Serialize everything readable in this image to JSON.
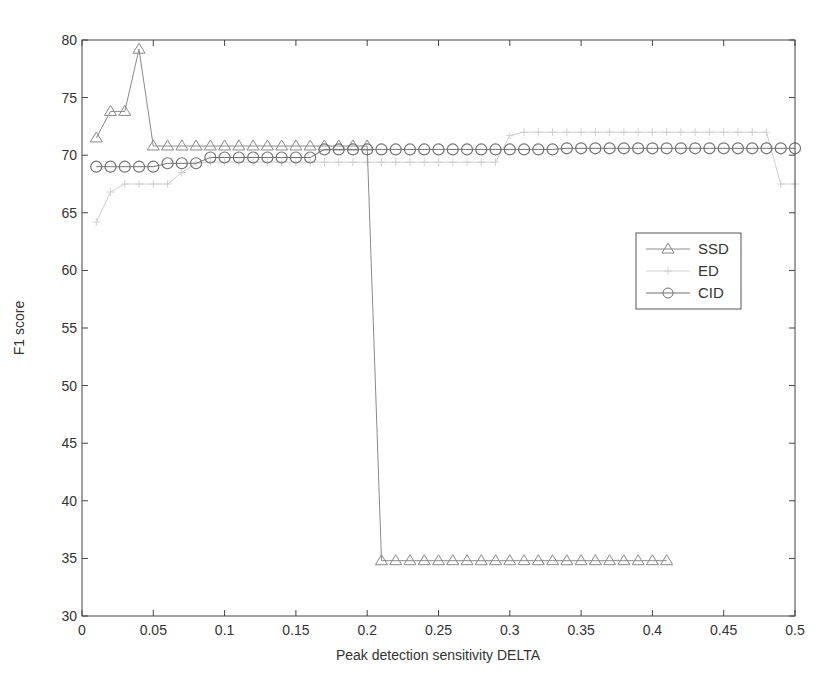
{
  "chart_data": {
    "type": "line",
    "title": "",
    "xlabel": "Peak detection sensitivity DELTA",
    "ylabel": "F1 score",
    "xlim": [
      0,
      0.5
    ],
    "ylim": [
      30,
      80
    ],
    "xticks": [
      0,
      0.05,
      0.1,
      0.15,
      0.2,
      0.25,
      0.3,
      0.35,
      0.4,
      0.45,
      0.5
    ],
    "xtick_labels": [
      "0",
      "0.05",
      "0.1",
      "0.15",
      "0.2",
      "0.25",
      "0.3",
      "0.35",
      "0.4",
      "0.45",
      "0.5"
    ],
    "yticks": [
      30,
      35,
      40,
      45,
      50,
      55,
      60,
      65,
      70,
      75,
      80
    ],
    "ytick_labels": [
      "30",
      "35",
      "40",
      "45",
      "50",
      "55",
      "60",
      "65",
      "70",
      "75",
      "80"
    ],
    "grid": false,
    "legend_position": "right-middle",
    "series": [
      {
        "name": "SSD",
        "marker": "triangle",
        "color": "#8a8a8a",
        "x": [
          0.01,
          0.02,
          0.03,
          0.04,
          0.05,
          0.06,
          0.07,
          0.08,
          0.09,
          0.1,
          0.11,
          0.12,
          0.13,
          0.14,
          0.15,
          0.16,
          0.17,
          0.18,
          0.19,
          0.2,
          0.21,
          0.22,
          0.23,
          0.24,
          0.25,
          0.26,
          0.27,
          0.28,
          0.29,
          0.3,
          0.31,
          0.32,
          0.33,
          0.34,
          0.35,
          0.36,
          0.37,
          0.38,
          0.39,
          0.4,
          0.41
        ],
        "values": [
          71.5,
          73.8,
          73.8,
          79.2,
          70.8,
          70.8,
          70.8,
          70.8,
          70.8,
          70.8,
          70.8,
          70.8,
          70.8,
          70.8,
          70.8,
          70.8,
          70.8,
          70.8,
          70.8,
          70.8,
          34.8,
          34.8,
          34.8,
          34.8,
          34.8,
          34.8,
          34.8,
          34.8,
          34.8,
          34.8,
          34.8,
          34.8,
          34.8,
          34.8,
          34.8,
          34.8,
          34.8,
          34.8,
          34.8,
          34.8,
          34.8
        ]
      },
      {
        "name": "ED",
        "marker": "plus",
        "color": "#d0d0d0",
        "x": [
          0.01,
          0.02,
          0.03,
          0.04,
          0.05,
          0.06,
          0.07,
          0.08,
          0.09,
          0.1,
          0.11,
          0.12,
          0.13,
          0.14,
          0.15,
          0.16,
          0.17,
          0.18,
          0.19,
          0.2,
          0.21,
          0.22,
          0.23,
          0.24,
          0.25,
          0.26,
          0.27,
          0.28,
          0.29,
          0.3,
          0.31,
          0.32,
          0.33,
          0.34,
          0.35,
          0.36,
          0.37,
          0.38,
          0.39,
          0.4,
          0.41,
          0.42,
          0.43,
          0.44,
          0.45,
          0.46,
          0.47,
          0.48,
          0.49,
          0.5
        ],
        "values": [
          64.2,
          66.8,
          67.5,
          67.5,
          67.5,
          67.5,
          68.5,
          69.3,
          69.4,
          69.4,
          69.4,
          69.4,
          69.4,
          69.4,
          69.4,
          69.4,
          69.4,
          69.4,
          69.4,
          69.4,
          69.4,
          69.4,
          69.4,
          69.4,
          69.4,
          69.4,
          69.4,
          69.4,
          69.4,
          71.7,
          72.0,
          72.0,
          72.0,
          72.0,
          72.0,
          72.0,
          72.0,
          72.0,
          72.0,
          72.0,
          72.0,
          72.0,
          72.0,
          72.0,
          72.0,
          72.0,
          72.0,
          72.0,
          67.5,
          67.5
        ]
      },
      {
        "name": "CID",
        "marker": "circle",
        "color": "#707070",
        "x": [
          0.01,
          0.02,
          0.03,
          0.04,
          0.05,
          0.06,
          0.07,
          0.08,
          0.09,
          0.1,
          0.11,
          0.12,
          0.13,
          0.14,
          0.15,
          0.16,
          0.17,
          0.18,
          0.19,
          0.2,
          0.21,
          0.22,
          0.23,
          0.24,
          0.25,
          0.26,
          0.27,
          0.28,
          0.29,
          0.3,
          0.31,
          0.32,
          0.33,
          0.34,
          0.35,
          0.36,
          0.37,
          0.38,
          0.39,
          0.4,
          0.41,
          0.42,
          0.43,
          0.44,
          0.45,
          0.46,
          0.47,
          0.48,
          0.49,
          0.5
        ],
        "values": [
          69.0,
          69.0,
          69.0,
          69.0,
          69.0,
          69.3,
          69.3,
          69.3,
          69.8,
          69.8,
          69.8,
          69.8,
          69.8,
          69.8,
          69.8,
          69.8,
          70.5,
          70.5,
          70.5,
          70.5,
          70.5,
          70.5,
          70.5,
          70.5,
          70.5,
          70.5,
          70.5,
          70.5,
          70.5,
          70.5,
          70.5,
          70.5,
          70.5,
          70.6,
          70.6,
          70.6,
          70.6,
          70.6,
          70.6,
          70.6,
          70.6,
          70.6,
          70.6,
          70.6,
          70.6,
          70.6,
          70.6,
          70.6,
          70.6,
          70.6
        ]
      }
    ]
  },
  "legend": {
    "items": [
      {
        "label": "SSD",
        "icon": "triangle-marker"
      },
      {
        "label": "ED",
        "icon": "plus-marker"
      },
      {
        "label": "CID",
        "icon": "circle-marker"
      }
    ]
  }
}
